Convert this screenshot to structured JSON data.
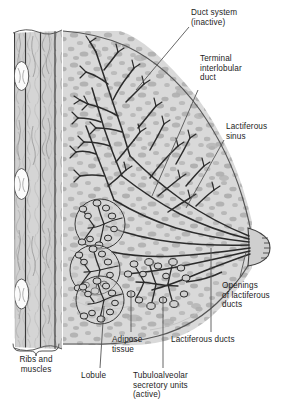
{
  "figure": {
    "type": "anatomical-illustration",
    "palette": {
      "background": "#ffffff",
      "tissue_fill": "#d6d6d6",
      "tissue_mottle": "#b3b3b3",
      "muscle_fill": "#cfcfcf",
      "muscle_stripe": "#bdbdbd",
      "rib_fill": "#fafafa",
      "duct_stroke": "#2b2b2b",
      "outline_stroke": "#4a4a4a",
      "leader_stroke": "#555555",
      "text": "#1d1d1d"
    }
  },
  "labels": {
    "duct_system": {
      "text": "Duct system\n(inactive)",
      "align": "left",
      "x": 191,
      "y": 8
    },
    "terminal_interlobular_duct": {
      "text": "Terminal\ninterlobular\nduct",
      "align": "left",
      "x": 200,
      "y": 54
    },
    "lactiferous_sinus": {
      "text": "Lactiferous\nsinus",
      "align": "left",
      "x": 226,
      "y": 122
    },
    "openings_of_lactiferous_ducts": {
      "text": "Openings\nof lactiferous\nducts",
      "align": "left",
      "x": 222,
      "y": 281
    },
    "lactiferous_ducts": {
      "text": "Lactiferous ducts",
      "align": "left",
      "x": 171,
      "y": 335
    },
    "adipose_tissue": {
      "text": "Adipose\ntissue",
      "align": "left",
      "x": 112,
      "y": 335
    },
    "tubuloalveolar_secretory_units": {
      "text": "Tubuloalveolar\nsecretory units\n(active)",
      "align": "left",
      "x": 133,
      "y": 371
    },
    "lobule": {
      "text": "Lobule",
      "align": "left",
      "x": 81,
      "y": 371
    },
    "ribs_and_muscles": {
      "text": "Ribs and\nmuscles",
      "align": "center",
      "x": 11,
      "y": 355
    }
  },
  "structures": {
    "ribs": {
      "count": 3,
      "name": "rib cross sections"
    },
    "muscle_bands": {
      "count": 4,
      "name": "intercostal muscle bands"
    },
    "lobules": {
      "count": 3,
      "name": "inactive lobules"
    },
    "active_units": {
      "count": 1,
      "name": "tubuloalveolar secretory unit cluster"
    },
    "nipple": {
      "name": "nipple with duct openings"
    }
  }
}
